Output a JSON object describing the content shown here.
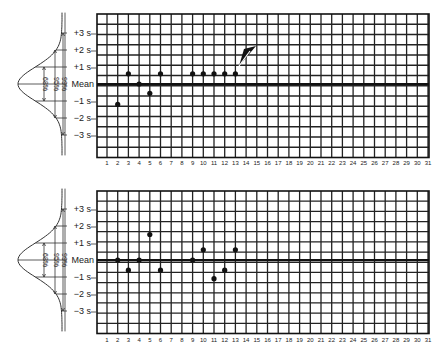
{
  "chart_data": [
    {
      "type": "scatter",
      "title": "",
      "xlabel": "",
      "ylabel": "",
      "x_ticks": [
        "1",
        "2",
        "3",
        "4",
        "5",
        "6",
        "7",
        "8",
        "9",
        "10",
        "11",
        "12",
        "13",
        "14",
        "15",
        "16",
        "17",
        "18",
        "19",
        "20",
        "21",
        "22",
        "23",
        "24",
        "25",
        "26",
        "27",
        "28",
        "29",
        "30",
        "31"
      ],
      "y_tick_labels": [
        "+3 s",
        "+2 s",
        "+1 s",
        "Mean",
        "−1 s",
        "−2 s",
        "−3 s"
      ],
      "y_tick_values": [
        3,
        2,
        1,
        0,
        -1,
        -2,
        -3
      ],
      "distribution_labels": [
        "68%",
        "95%",
        "99%"
      ],
      "xlim": [
        1,
        31
      ],
      "ylim_sd": [
        -4.2,
        4.2
      ],
      "grid": true,
      "annotation": "arrow pointing at run of points at day 13",
      "series": [
        {
          "name": "control values",
          "x": [
            2,
            3,
            4,
            5,
            6,
            9,
            10,
            11,
            12,
            13
          ],
          "y": [
            -1.2,
            0.6,
            0,
            -0.55,
            0.6,
            0.6,
            0.6,
            0.6,
            0.6,
            0.6
          ]
        }
      ]
    },
    {
      "type": "scatter",
      "title": "",
      "xlabel": "",
      "ylabel": "",
      "x_ticks": [
        "1",
        "2",
        "3",
        "4",
        "5",
        "6",
        "7",
        "8",
        "9",
        "10",
        "11",
        "12",
        "13",
        "14",
        "15",
        "16",
        "17",
        "18",
        "19",
        "20",
        "21",
        "22",
        "23",
        "24",
        "25",
        "26",
        "27",
        "28",
        "29",
        "30",
        "31"
      ],
      "y_tick_labels": [
        "+3 s",
        "+2 s",
        "+1 s",
        "Mean",
        "−1 s",
        "−2 s",
        "−3 s"
      ],
      "y_tick_values": [
        3,
        2,
        1,
        0,
        -1,
        -2,
        -3
      ],
      "distribution_labels": [
        "68%",
        "95%",
        "99%"
      ],
      "xlim": [
        1,
        31
      ],
      "ylim_sd": [
        -4.2,
        4.2
      ],
      "grid": true,
      "series": [
        {
          "name": "control values",
          "x": [
            2,
            3,
            4,
            5,
            6,
            9,
            10,
            11,
            12,
            13
          ],
          "y": [
            0,
            -0.6,
            0,
            1.5,
            -0.6,
            0,
            0.6,
            -1.1,
            -0.6,
            0.6
          ]
        }
      ]
    }
  ]
}
